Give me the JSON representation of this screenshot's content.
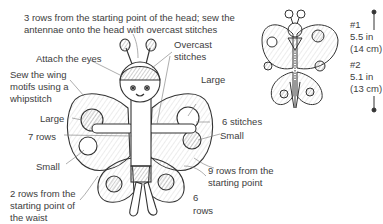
{
  "diagram": {
    "main_figure": {
      "labels": {
        "head_note_line1": "3 rows from the starting point of the head; sew the",
        "head_note_line2": "antennae onto the head with overcast stitches",
        "attach_eyes": "Attach the eyes",
        "overcast_line1": "Overcast",
        "overcast_line2": "stitches",
        "sew_wing_line1": "Sew the wing",
        "sew_wing_line2": "motifs using a",
        "sew_wing_line3": "whipstitch",
        "large_left": "Large",
        "large_right": "Large",
        "six_stitches": "6 stitches",
        "seven_rows": "7 rows",
        "small_right": "Small",
        "small_left": "Small",
        "nine_rows_line1": "9 rows from the",
        "nine_rows_line2": "starting point",
        "waist_line1": "2 rows from the",
        "waist_line2": "starting point of",
        "waist_line3": "the waist",
        "six_rows_line1": "6",
        "six_rows_line2": "rows"
      }
    },
    "size_figure": {
      "size1_label": "#1",
      "size1_in": "5.5 in",
      "size1_cm": "(14 cm)",
      "size2_label": "#2",
      "size2_in": "5.1 in",
      "size2_cm": "(13 cm)"
    },
    "colors": {
      "ink": "#3d3d3d",
      "shade": "#9a9a9a",
      "background": "#ffffff"
    }
  }
}
